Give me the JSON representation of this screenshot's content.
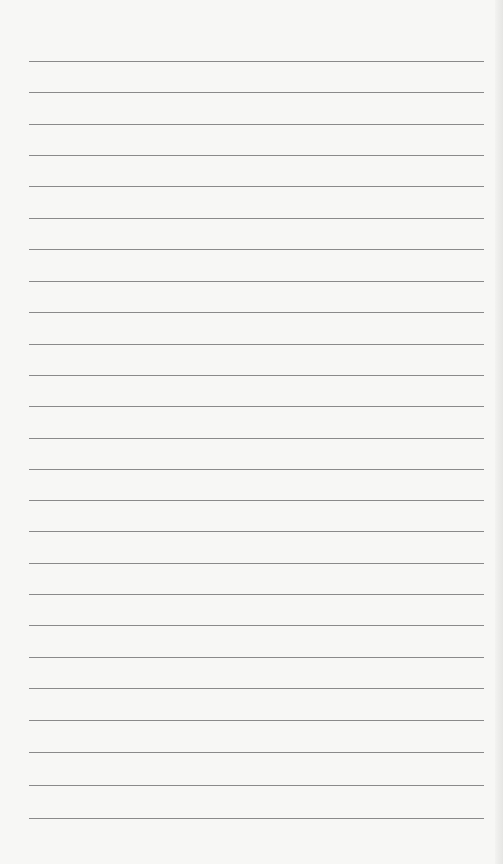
{
  "page": {
    "type": "lined-paper",
    "background": "#f7f7f5",
    "line_color": "#8a8a8a"
  },
  "lines": [
    61,
    92,
    124,
    155,
    186,
    218,
    249,
    281,
    312,
    344,
    375,
    406,
    438,
    469,
    500,
    531,
    563,
    594,
    625,
    657,
    688,
    720,
    752,
    785,
    818
  ]
}
